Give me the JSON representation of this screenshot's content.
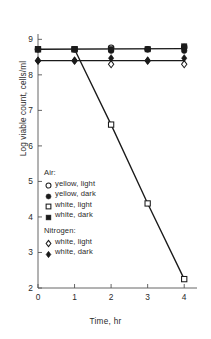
{
  "chart_data": {
    "type": "scatter",
    "title": "",
    "xlabel": "Time, hr",
    "ylabel": "Log viable count, cells/ml",
    "xlim": [
      0,
      4.35
    ],
    "ylim": [
      2,
      9.15
    ],
    "xticks": [
      0,
      1,
      2,
      3,
      4
    ],
    "xticklabels": [
      "0",
      "1",
      "2",
      "3",
      "4"
    ],
    "yticks": [
      2,
      3,
      4,
      5,
      6,
      7,
      8,
      9
    ],
    "yticklabels": [
      "2",
      "3",
      "4",
      "5",
      "6",
      "7",
      "8",
      "9"
    ],
    "grid": false,
    "legend_position": "inside-lower-left",
    "series": [
      {
        "name": "Air: yellow, light",
        "marker": "open-circle",
        "x": [
          0,
          1,
          2,
          3,
          4
        ],
        "y": [
          8.72,
          8.72,
          8.76,
          8.72,
          8.78
        ]
      },
      {
        "name": "Air: yellow, dark",
        "marker": "filled-circle",
        "x": [
          0,
          1,
          2,
          3,
          4
        ],
        "y": [
          8.72,
          8.72,
          8.68,
          8.72,
          8.68
        ]
      },
      {
        "name": "Air: white, light",
        "marker": "open-square",
        "x": [
          0,
          1,
          2,
          3,
          4
        ],
        "y": [
          8.72,
          8.72,
          6.6,
          4.38,
          2.25
        ]
      },
      {
        "name": "Air: white, dark",
        "marker": "filled-square",
        "x": [
          0,
          1,
          2,
          3,
          4
        ],
        "y": [
          8.72,
          8.72,
          8.72,
          8.72,
          8.8
        ]
      },
      {
        "name": "Nitrogen: white, light",
        "marker": "open-diamond",
        "x": [
          0,
          1,
          2,
          3,
          4
        ],
        "y": [
          8.4,
          8.4,
          8.3,
          8.4,
          8.3
        ]
      },
      {
        "name": "Nitrogen: white, dark",
        "marker": "filled-diamond",
        "x": [
          0,
          1,
          2,
          3,
          4
        ],
        "y": [
          8.4,
          8.4,
          8.47,
          8.4,
          8.47
        ]
      }
    ],
    "lines": [
      {
        "name": "upper-plateau",
        "x": [
          0,
          4
        ],
        "y": [
          8.72,
          8.74
        ]
      },
      {
        "name": "lower-plateau",
        "x": [
          0,
          4
        ],
        "y": [
          8.4,
          8.4
        ]
      },
      {
        "name": "white-light-air-decline",
        "x": [
          1,
          2,
          3,
          4
        ],
        "y": [
          8.72,
          6.6,
          4.38,
          2.25
        ]
      }
    ],
    "legend": [
      {
        "group": "Air:",
        "entries": [
          {
            "label": "yellow, light",
            "marker": "open-circle"
          },
          {
            "label": "yellow, dark",
            "marker": "filled-circle"
          },
          {
            "label": "white, light",
            "marker": "open-square"
          },
          {
            "label": "white, dark",
            "marker": "filled-square"
          }
        ]
      },
      {
        "group": "Nitrogen:",
        "entries": [
          {
            "label": "white, light",
            "marker": "open-diamond"
          },
          {
            "label": "white, dark",
            "marker": "filled-diamond"
          }
        ]
      }
    ],
    "colors": {
      "ink": "#1a1a1a",
      "axis": "#555555",
      "background": "#ffffff"
    }
  }
}
